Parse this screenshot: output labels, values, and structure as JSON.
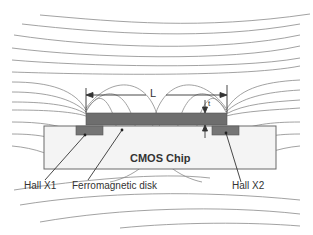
{
  "diagram": {
    "type": "magnetic field lines around ferromagnetic disk on CMOS chip",
    "labels": {
      "length": "L",
      "thickness": "t",
      "chip": "CMOS Chip",
      "hall_left": "Hall X1",
      "hall_right": "Hall X2",
      "disk": "Ferromagnetic disk"
    },
    "colors": {
      "field_line": "#8a8a8a",
      "disk": "#6e6e6e",
      "hall_sensor": "#757575",
      "chip_fill": "#f4f4f4",
      "chip_border": "#6a6a6a",
      "text": "#333333"
    }
  }
}
